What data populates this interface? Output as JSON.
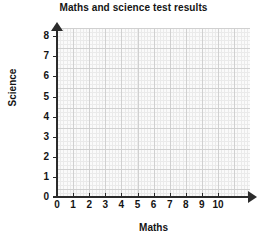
{
  "chart_data": {
    "type": "scatter",
    "title": "Maths and science test results",
    "xlabel": "Maths",
    "ylabel": "Science",
    "xlim": [
      0,
      10
    ],
    "ylim": [
      0,
      8
    ],
    "x_ticks": [
      "0",
      "1",
      "2",
      "3",
      "4",
      "5",
      "6",
      "7",
      "8",
      "9",
      "10"
    ],
    "y_ticks": [
      "0",
      "1",
      "2",
      "3",
      "4",
      "5",
      "6",
      "7",
      "8"
    ],
    "grid": true,
    "minor_grid": true,
    "minor_divisions": 5,
    "legend": null,
    "series": [
      {
        "name": "test results",
        "points": []
      }
    ],
    "annotations": [],
    "colors": {
      "axis": "#2b2b2b",
      "major_grid": "#d0d0d0",
      "minor_grid": "#eaeaea",
      "plot_background": "#fafafa",
      "page_background": "#ffffff",
      "text": "#141414"
    }
  }
}
